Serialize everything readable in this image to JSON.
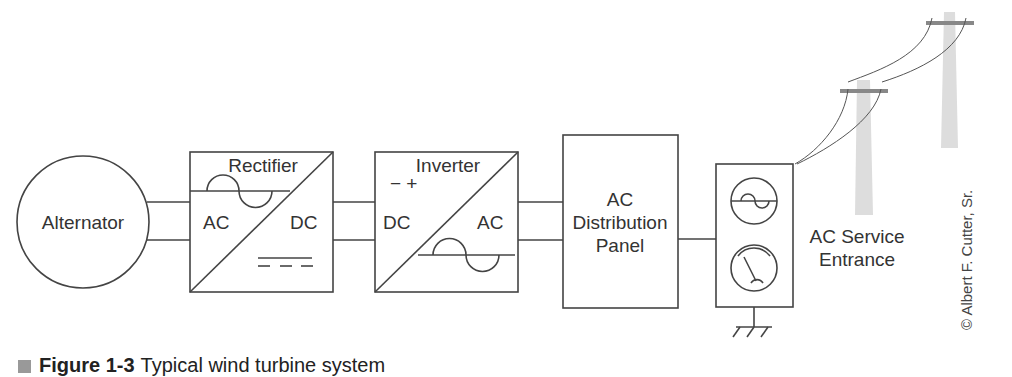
{
  "diagram": {
    "blocks": {
      "alternator": "Alternator",
      "rectifier": {
        "title": "Rectifier",
        "input": "AC",
        "output": "DC"
      },
      "inverter": {
        "title": "Inverter",
        "polarity": "− +",
        "input": "DC",
        "output": "AC"
      },
      "distribution": {
        "line1": "AC",
        "line2": "Distribution",
        "line3": "Panel"
      },
      "service": {
        "line1": "AC Service",
        "line2": "Entrance"
      }
    },
    "credit": "© Albert F. Cutter, Sr.",
    "caption": {
      "figure": "Figure 1-3",
      "text": "Typical wind turbine system"
    }
  }
}
